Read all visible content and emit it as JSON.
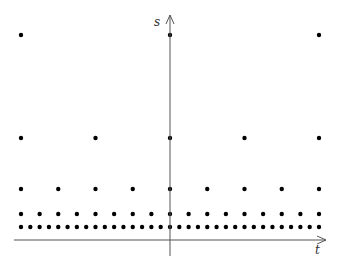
{
  "diagram": {
    "axes": {
      "horizontal": {
        "label": "t",
        "x_start": 14,
        "x_end": 326,
        "y": 240
      },
      "vertical": {
        "label": "s",
        "x": 170,
        "y_start": 256,
        "y_end": 15
      }
    },
    "origin_x": 170,
    "x_min": 21,
    "x_max": 319,
    "rows": [
      {
        "y": 35,
        "count": 3
      },
      {
        "y": 138,
        "count": 5
      },
      {
        "y": 189,
        "count": 9
      },
      {
        "y": 214,
        "count": 17
      },
      {
        "y": 227,
        "count": 33
      }
    ],
    "colors": {
      "dot": "#000000",
      "axis": "#555555"
    }
  }
}
